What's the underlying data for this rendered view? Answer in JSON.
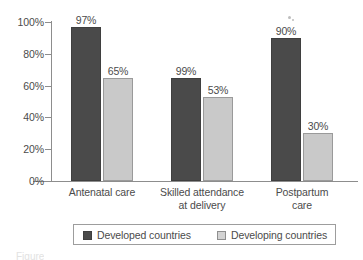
{
  "chart_data": {
    "type": "bar",
    "title": "",
    "subtitle": "",
    "xlabel": "",
    "ylabel": "",
    "ylim": [
      0,
      100
    ],
    "yticks": [
      "0%",
      "20%",
      "40%",
      "60%",
      "80%",
      "100%"
    ],
    "ytick_values": [
      0,
      20,
      40,
      60,
      80,
      100
    ],
    "grid": false,
    "legend_position": "bottom",
    "value_suffix": "%",
    "categories": [
      {
        "lines": [
          "Antenatal care"
        ]
      },
      {
        "lines": [
          "Skilled attendance",
          "at delivery"
        ]
      },
      {
        "lines": [
          "Postpartum",
          "care"
        ]
      }
    ],
    "series": [
      {
        "name": "Developed countries",
        "color": "#4a4a4a",
        "values": [
          97,
          65,
          90
        ],
        "labels": [
          "97%",
          "99%",
          "90%"
        ]
      },
      {
        "name": "Developing countries",
        "color": "#c9c9c9",
        "values": [
          65,
          53,
          30
        ],
        "labels": [
          "65%",
          "53%",
          "30%"
        ]
      }
    ],
    "bars": [
      {
        "group": 0,
        "series": 0,
        "value": 97,
        "label": "97%"
      },
      {
        "group": 0,
        "series": 1,
        "value": 65,
        "label": "65%"
      },
      {
        "group": 1,
        "series": 0,
        "value": 99,
        "label": "99%"
      },
      {
        "group": 1,
        "series": 1,
        "value": 53,
        "label": "53%"
      },
      {
        "group": 2,
        "series": 0,
        "value": 90,
        "label": "90%"
      },
      {
        "group": 2,
        "series": 1,
        "value": 30,
        "label": "30%"
      }
    ]
  },
  "legend": {
    "entries": [
      {
        "label": "Developed countries",
        "swatch": "developed"
      },
      {
        "label": "Developing countries",
        "swatch": "developing"
      }
    ]
  },
  "caption": {
    "text": "Figure"
  },
  "colors": {
    "developed": "#4a4a4a",
    "developing": "#c9c9c9",
    "axis": "#8d8d8d",
    "text": "#4b4b4b",
    "background": "#ffffff"
  }
}
